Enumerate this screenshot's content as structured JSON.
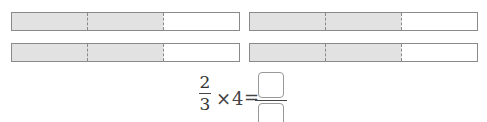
{
  "colors": {
    "shaded": "#e2e2e2",
    "border": "#8a8a8a",
    "unshaded": "#ffffff"
  },
  "bars": [
    {
      "id": "top-left",
      "segments": 3,
      "shaded": 2
    },
    {
      "id": "top-right",
      "segments": 3,
      "shaded": 2
    },
    {
      "id": "bottom-left",
      "segments": 3,
      "shaded": 2
    },
    {
      "id": "bottom-right",
      "segments": 3,
      "shaded": 2
    }
  ],
  "equation": {
    "fraction": {
      "numerator": "2",
      "denominator": "3"
    },
    "times_symbol": "×",
    "multiplier": "4",
    "equals_symbol": "=",
    "answer": {
      "numerator": "",
      "denominator": ""
    }
  }
}
